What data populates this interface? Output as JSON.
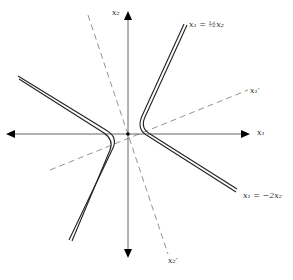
{
  "figure": {
    "type": "hyperbola-with-rotated-axes",
    "axes": {
      "x1_label": "x₁",
      "x2_label": "x₂",
      "x1_prime_label": "x₁′",
      "x2_prime_label": "x₂′"
    },
    "asymptotes": [
      {
        "label": "x₁ = ½x₂"
      },
      {
        "label": "x₁ = −2x₂"
      }
    ],
    "colors": {
      "axis": "#555555",
      "curve": "#222222",
      "dashed": "#777777"
    }
  }
}
